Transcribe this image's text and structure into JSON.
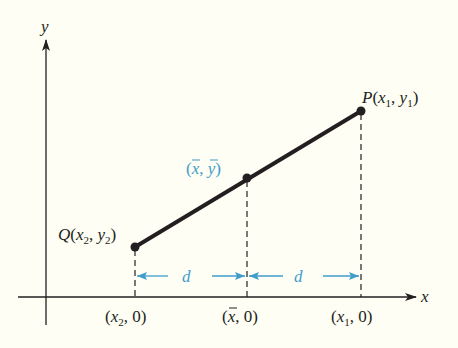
{
  "figure": {
    "background": "#fefef4",
    "axes": {
      "x_label": "x",
      "y_label": "y",
      "color": "#231f20"
    },
    "points": {
      "P": {
        "name": "P",
        "sub_x": "1",
        "sub_y": "1"
      },
      "Q": {
        "name": "Q",
        "sub_x": "2",
        "sub_y": "2"
      },
      "M": {
        "label_x": "x",
        "label_y": "y",
        "color": "#3f9ccb"
      }
    },
    "x_ticks": [
      {
        "label_var": "x",
        "sub": "2",
        "tail": ", 0)"
      },
      {
        "label_var": "x",
        "bar": true,
        "tail": ", 0)"
      },
      {
        "label_var": "x",
        "sub": "1",
        "tail": ", 0)"
      }
    ],
    "distance": {
      "label": "d",
      "color": "#3f9ccb"
    }
  }
}
